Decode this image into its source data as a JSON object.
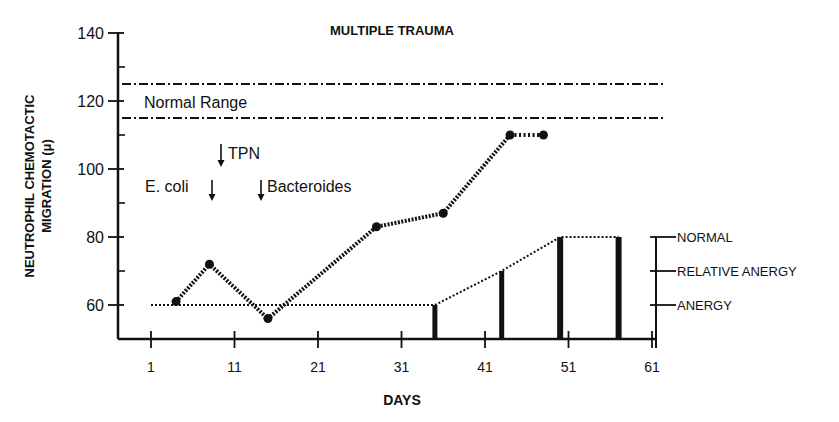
{
  "chart_data": {
    "type": "line",
    "title": "MULTIPLE TRAUMA",
    "xlabel": "DAYS",
    "ylabel": [
      "NEUTROPHIL CHEMOTACTIC",
      "MIGRATION (μ)"
    ],
    "xlim": [
      1,
      61
    ],
    "ylim": [
      50,
      140
    ],
    "x_ticks": [
      1,
      11,
      21,
      31,
      41,
      51,
      61
    ],
    "y_ticks": [
      60,
      80,
      100,
      120,
      140
    ],
    "y_minor_ticks": [
      70,
      90,
      110,
      130
    ],
    "grid": false,
    "normal_range": {
      "label": "Normal Range",
      "lower": 115,
      "upper": 125,
      "style": "dash-dot"
    },
    "series": [
      {
        "name": "Neutrophil chemotactic migration",
        "style": "dotted-with-markers",
        "x": [
          4,
          8,
          15,
          28,
          36,
          44,
          48
        ],
        "y": [
          61,
          72,
          56,
          83,
          87,
          110,
          110
        ]
      },
      {
        "name": "Skin test reactivity",
        "style": "bars",
        "x": [
          35,
          43,
          50,
          57
        ],
        "y": [
          60,
          70,
          80,
          80
        ],
        "levels": [
          "ANERGY",
          "RELATIVE ANERGY",
          "NORMAL",
          "NORMAL"
        ],
        "baseline_dotted": {
          "x_start": 1,
          "x_end": 35,
          "y": 60
        }
      }
    ],
    "annotations": [
      {
        "text": "TPN",
        "x": 9,
        "y": 105,
        "arrow": "down"
      },
      {
        "text": "E. coli",
        "x": 8,
        "y": 97,
        "arrow": "down"
      },
      {
        "text": "Bacteroides",
        "x": 14,
        "y": 97,
        "arrow": "down"
      }
    ],
    "right_axis": {
      "labels": [
        "NORMAL",
        "RELATIVE ANERGY",
        "ANERGY"
      ],
      "values": [
        80,
        70,
        60
      ]
    }
  }
}
